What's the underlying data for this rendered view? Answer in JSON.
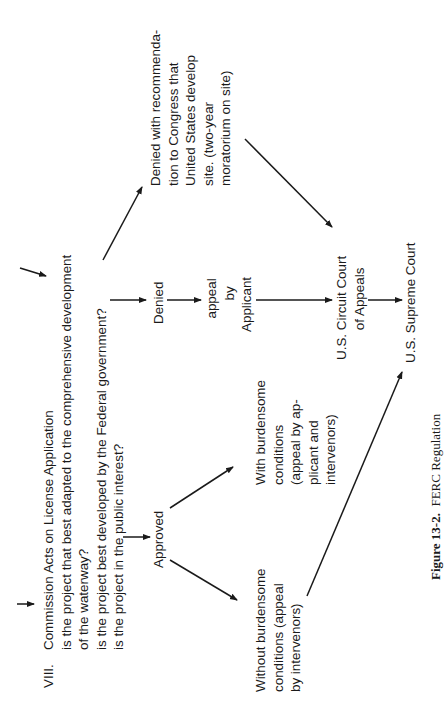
{
  "figure": {
    "caption_label": "Figure 13-2.",
    "caption_text": "FERC Regulation",
    "orientation": "rotated 90° counter-clockwise"
  },
  "step": {
    "number": "VIII.",
    "title": "Commission Acts on License Application",
    "questions": [
      "is the project that best adapted to the comprehensive development",
      "of the waterway?",
      "is the project best developed by the Federal government?",
      "is the project in the public interest?"
    ]
  },
  "nodes": {
    "approved": "Approved",
    "denied": "Denied",
    "appeal_by_applicant": [
      "appeal",
      "by",
      "Applicant"
    ],
    "denied_with_recommendation": [
      "Denied with recommenda-",
      "tion to Congress that",
      "United States develop",
      "site. (two-year",
      "moratorium on site)"
    ],
    "with_burdensome": [
      "With burdensome",
      "conditions",
      "(appeal by ap-",
      "plicant and",
      "intervenors)"
    ],
    "without_burdensome": [
      "Without burdensome",
      "conditions (appeal",
      "by intervenors)"
    ],
    "circuit_court": [
      "U.S. Circuit Court",
      "of Appeals"
    ],
    "supreme_court": "U.S. Supreme Court"
  },
  "edges": [
    {
      "from": "incoming",
      "to": "step-VIII"
    },
    {
      "from": "incoming",
      "to": "step-VIII (upper)"
    },
    {
      "from": "step-VIII",
      "to": "approved"
    },
    {
      "from": "step-VIII",
      "to": "denied"
    },
    {
      "from": "step-VIII",
      "to": "denied_with_recommendation"
    },
    {
      "from": "denied",
      "to": "appeal_by_applicant"
    },
    {
      "from": "appeal_by_applicant",
      "to": "circuit_court"
    },
    {
      "from": "denied_with_recommendation",
      "to": "circuit_court"
    },
    {
      "from": "approved",
      "to": "with_burdensome"
    },
    {
      "from": "approved",
      "to": "without_burdensome"
    },
    {
      "from": "without_burdensome",
      "to": "supreme_court"
    },
    {
      "from": "circuit_court",
      "to": "supreme_court"
    }
  ]
}
